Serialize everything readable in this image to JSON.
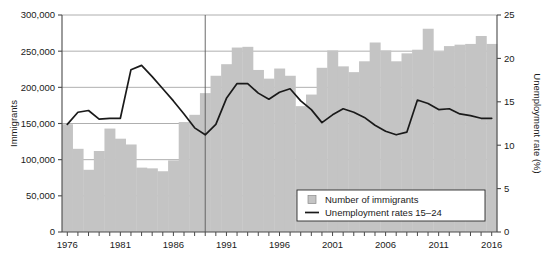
{
  "chart_data": {
    "type": "bar",
    "title": "",
    "subtitle": "",
    "xlabel": "",
    "ylabel": "Immigrants",
    "y2label": "Unemployment rate (%)",
    "xlim": [
      1975.5,
      2016.5
    ],
    "ylim": [
      0,
      300000
    ],
    "y2lim": [
      0,
      25
    ],
    "grid": true,
    "legend_position": "bottom-right",
    "y_ticks": [
      0,
      50000,
      100000,
      150000,
      200000,
      250000,
      300000
    ],
    "y_tick_labels": [
      "0",
      "50,000",
      "100,000",
      "150,000",
      "200,000",
      "250,000",
      "300,000"
    ],
    "y2_ticks": [
      0,
      5,
      10,
      15,
      20,
      25
    ],
    "y2_tick_labels": [
      "0",
      "5",
      "10",
      "15",
      "20",
      "25"
    ],
    "x_ticks": [
      1976,
      1977,
      1978,
      1979,
      1980,
      1981,
      1982,
      1983,
      1984,
      1985,
      1986,
      1987,
      1988,
      1989,
      1990,
      1991,
      1992,
      1993,
      1994,
      1995,
      1996,
      1997,
      1998,
      1999,
      2000,
      2001,
      2002,
      2003,
      2004,
      2005,
      2006,
      2007,
      2008,
      2009,
      2010,
      2011,
      2012,
      2013,
      2014,
      2015,
      2016
    ],
    "x_tick_labels": [
      "1976",
      "",
      "",
      "",
      "",
      "1981",
      "",
      "",
      "",
      "",
      "1986",
      "",
      "",
      "",
      "",
      "1991",
      "",
      "",
      "",
      "",
      "1996",
      "",
      "",
      "",
      "",
      "2001",
      "",
      "",
      "",
      "",
      "2006",
      "",
      "",
      "",
      "",
      "2011",
      "",
      "",
      "",
      "",
      "2016"
    ],
    "annotations": [
      {
        "type": "vline",
        "x": 1989,
        "label": ""
      }
    ],
    "categories": [
      1976,
      1977,
      1978,
      1979,
      1980,
      1981,
      1982,
      1983,
      1984,
      1985,
      1986,
      1987,
      1988,
      1989,
      1990,
      1991,
      1992,
      1993,
      1994,
      1995,
      1996,
      1997,
      1998,
      1999,
      2000,
      2001,
      2002,
      2003,
      2004,
      2005,
      2006,
      2007,
      2008,
      2009,
      2010,
      2011,
      2012,
      2013,
      2014,
      2015,
      2016
    ],
    "series": [
      {
        "name": "Number of immigrants",
        "type": "bar",
        "axis": "left",
        "color": "#c4c4c4",
        "values": [
          149000,
          115000,
          86000,
          112000,
          143000,
          129000,
          121000,
          89000,
          88000,
          84000,
          99000,
          152000,
          162000,
          192000,
          216000,
          232000,
          255000,
          256000,
          224000,
          212000,
          226000,
          216000,
          174000,
          190000,
          227000,
          251000,
          229000,
          221000,
          236000,
          262000,
          251000,
          236000,
          247000,
          252000,
          281000,
          249000,
          257000,
          259000,
          260000,
          271000,
          260000
        ]
      },
      {
        "name": "Unemployment rates 15–24",
        "type": "line",
        "axis": "right",
        "color": "#1a1a1a",
        "values": [
          12.4,
          13.8,
          14.0,
          13.0,
          13.1,
          13.1,
          18.7,
          19.2,
          17.9,
          16.5,
          15.1,
          13.6,
          12.0,
          11.2,
          12.4,
          15.4,
          17.1,
          17.1,
          16.0,
          15.3,
          16.1,
          16.5,
          15.1,
          14.1,
          12.6,
          13.5,
          14.2,
          13.8,
          13.2,
          12.3,
          11.6,
          11.2,
          11.5,
          15.2,
          14.8,
          14.1,
          14.2,
          13.6,
          13.4,
          13.1,
          13.1
        ]
      }
    ],
    "legend": [
      {
        "label": "Number of immigrants",
        "marker": "square",
        "color": "#c4c4c4"
      },
      {
        "label": "Unemployment rates 15–24",
        "marker": "line",
        "color": "#1a1a1a"
      }
    ]
  },
  "colors": {
    "bar": "#c4c4c4",
    "line": "#1a1a1a",
    "axis": "#4a4a4a",
    "grid": "#9a9a9a",
    "background": "#ffffff",
    "legend_background": "#ffffff"
  }
}
